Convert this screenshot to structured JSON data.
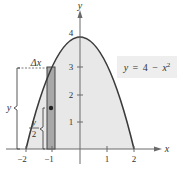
{
  "diagram": {
    "equation": "y = 4 − x²",
    "equation_parts": {
      "lhs": "y",
      "eq": "=",
      "const": "4",
      "minus": "−",
      "var": "x",
      "exp": "2"
    },
    "axes": {
      "x_label": "x",
      "y_label": "y",
      "x_ticks": [
        "−2",
        "−1",
        "1",
        "2"
      ],
      "y_ticks": [
        "1",
        "2",
        "3",
        "4"
      ]
    },
    "annotations": {
      "delta_x": "Δx",
      "height_label": "y",
      "half_height_num": "y",
      "half_height_den": "2"
    },
    "colors": {
      "region_fill": "#e8e8e8",
      "curve": "#3a3a3a",
      "strip_fill": "#a8a8a8",
      "axis": "#6a6a6a",
      "equation_box": "#eeeeee"
    }
  }
}
